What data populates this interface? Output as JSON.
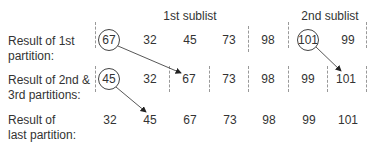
{
  "headers": {
    "first_sublist": "1st sublist",
    "second_sublist": "2nd sublist"
  },
  "rows": [
    {
      "label_line1": "Result of 1st",
      "label_line2": "partition:",
      "values": [
        "67",
        "32",
        "45",
        "73",
        "98",
        "101",
        "99"
      ],
      "circled_index": [
        0,
        5
      ]
    },
    {
      "label_line1": "Result of 2nd &",
      "label_line2": "3rd partitions:",
      "values": [
        "45",
        "32",
        "67",
        "73",
        "98",
        "99",
        "101"
      ],
      "circled_index": [
        0
      ]
    },
    {
      "label_line1": "Result of",
      "label_line2": "last partition:",
      "values": [
        "32",
        "45",
        "67",
        "73",
        "98",
        "99",
        "101"
      ],
      "circled_index": []
    }
  ],
  "arrows": [
    {
      "from": "row1 67 (pivot)",
      "to": "row2 67"
    },
    {
      "from": "row1 101 (pivot)",
      "to": "row2 101"
    },
    {
      "from": "row2 45 (pivot)",
      "to": "row3 45"
    }
  ],
  "colors": {
    "text": "#333333",
    "dashed": "#999999",
    "circle": "#444444"
  }
}
